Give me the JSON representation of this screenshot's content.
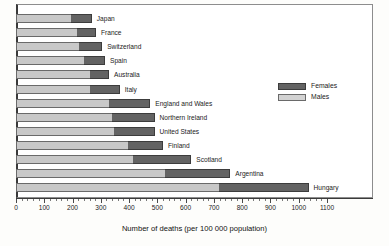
{
  "chart_data": {
    "type": "bar",
    "orientation": "horizontal",
    "stacked": true,
    "title": "",
    "xlabel": "Number of deaths (per 100 000 population)",
    "ylabel": "",
    "xlim": [
      0,
      1100
    ],
    "xticks": [
      0,
      100,
      200,
      300,
      400,
      500,
      600,
      700,
      800,
      900,
      1000,
      1100
    ],
    "xtick_labels": [
      "0",
      "100",
      "200",
      "300",
      "400",
      "500",
      "600",
      "700",
      "800",
      "900",
      "1000",
      "1100"
    ],
    "grid": false,
    "legend_position": "right",
    "categories": [
      "Japan",
      "France",
      "Switzerland",
      "Spain",
      "Australia",
      "Italy",
      "England and Wales",
      "Northern Ireland",
      "United States",
      "Finland",
      "Scotland",
      "Argentina",
      "Hungary"
    ],
    "series": [
      {
        "name": "Males",
        "color": "#c8c8c8",
        "values": [
          194,
          215,
          222,
          240,
          262,
          262,
          330,
          340,
          347,
          395,
          415,
          528,
          717
        ]
      },
      {
        "name": "Females",
        "color": "#636363",
        "values": [
          74,
          68,
          83,
          75,
          67,
          105,
          145,
          150,
          143,
          125,
          205,
          230,
          318
        ]
      }
    ],
    "totals": [
      268,
      283,
      305,
      315,
      329,
      367,
      475,
      490,
      490,
      520,
      620,
      758,
      1035
    ]
  },
  "legend": {
    "items": [
      {
        "label": "Females",
        "swatch": "females"
      },
      {
        "label": "Males",
        "swatch": "males"
      }
    ]
  }
}
